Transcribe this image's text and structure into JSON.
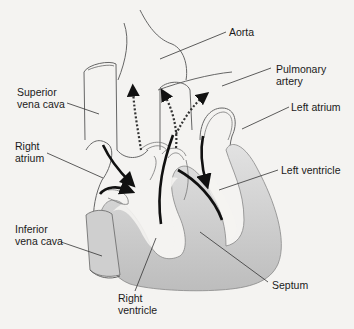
{
  "diagram": {
    "type": "anatomical-heart-cross-section",
    "colors": {
      "background": "#f4f3f1",
      "outline": "#555555",
      "muscle_fill": "#c9c9c9",
      "blood_flow_arrow": "#111111"
    },
    "labels": {
      "aorta": {
        "line1": "Aorta"
      },
      "pulmonary_artery": {
        "line1": "Pulmonary",
        "line2": "artery"
      },
      "superior_vena_cava": {
        "line1": "Superior",
        "line2": "vena cava"
      },
      "left_atrium": {
        "line1": "Left atrium"
      },
      "right_atrium": {
        "line1": "Right",
        "line2": "atrium"
      },
      "left_ventricle": {
        "line1": "Left ventricle"
      },
      "inferior_vena_cava": {
        "line1": "Inferior",
        "line2": "vena cava"
      },
      "septum": {
        "line1": "Septum"
      },
      "right_ventricle": {
        "line1": "Right",
        "line2": "ventricle"
      }
    }
  }
}
